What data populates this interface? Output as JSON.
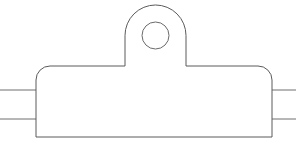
{
  "canvas": {
    "width": 296,
    "height": 153,
    "background": "#ffffff",
    "title": "Mounting bracket with tab and through-hole on shaft"
  },
  "style": {
    "outline_color": "#5a5a5a",
    "hole_color": "#6a6a6a",
    "shaft_color": "#6e6e6e",
    "fill_color": "#ffffff",
    "stroke_width": 1
  },
  "geometry": {
    "body": {
      "left": 36,
      "right": 272,
      "top": 66,
      "bottom": 137,
      "corner_radius_top": 14,
      "corner_radius_bottom": 0
    },
    "tab": {
      "left": 125,
      "right": 186,
      "top": 5,
      "base": 66,
      "arc_radius": 30.5
    },
    "hole": {
      "cx": 155.5,
      "cy": 35.5,
      "r": 13.5
    },
    "shaft": {
      "top_y": 90,
      "bottom_y": 119,
      "left_start": 0,
      "left_end": 36,
      "right_start": 272,
      "right_end": 296
    }
  },
  "paths": {
    "part_outline": "M 36 80 A 14 14 0 0 1 50 66 L 125 66 L 125 35.5 A 30.5 30.5 0 0 1 186 35.5 L 186 66 L 258 66 A 14 14 0 0 1 272 80 L 272 137 L 36 137 Z",
    "shaft_top_left": "M 0 90 L 36 90",
    "shaft_bottom_left": "M 0 119 L 36 119",
    "shaft_top_right": "M 272 90 L 296 90",
    "shaft_bottom_right": "M 272 119 L 296 119"
  },
  "labels": {
    "part_name": "bracket-body",
    "tab_name": "mounting-tab",
    "hole_name": "through-hole",
    "shaft_name": "shaft-bar"
  }
}
